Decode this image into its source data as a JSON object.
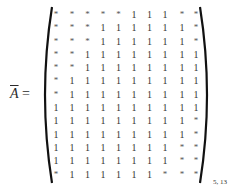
{
  "equation": {
    "lhs_symbol": "A",
    "lhs_decoration": "overline",
    "equals": "=",
    "subscript": "5, 13"
  },
  "matrix": {
    "rows": 13,
    "cols": 10,
    "entries": [
      [
        "*",
        "*",
        "*",
        "*",
        "*",
        "1",
        "1",
        "1",
        "*",
        "*"
      ],
      [
        "*",
        "*",
        "*",
        "1",
        "1",
        "1",
        "1",
        "1",
        "1",
        "*"
      ],
      [
        "*",
        "*",
        "*",
        "1",
        "1",
        "1",
        "1",
        "1",
        "1",
        "*"
      ],
      [
        "*",
        "*",
        "1",
        "1",
        "1",
        "1",
        "1",
        "1",
        "1",
        "1"
      ],
      [
        "*",
        "*",
        "1",
        "1",
        "1",
        "1",
        "1",
        "1",
        "1",
        "1"
      ],
      [
        "*",
        "1",
        "1",
        "1",
        "1",
        "1",
        "1",
        "1",
        "1",
        "1"
      ],
      [
        "*",
        "1",
        "1",
        "1",
        "1",
        "1",
        "1",
        "1",
        "1",
        "1"
      ],
      [
        "1",
        "1",
        "1",
        "1",
        "1",
        "1",
        "1",
        "1",
        "1",
        "1"
      ],
      [
        "1",
        "1",
        "1",
        "1",
        "1",
        "1",
        "1",
        "1",
        "1",
        "*"
      ],
      [
        "1",
        "1",
        "1",
        "1",
        "1",
        "1",
        "1",
        "1",
        "1",
        "*"
      ],
      [
        "1",
        "1",
        "1",
        "1",
        "1",
        "1",
        "1",
        "1",
        "*",
        "*"
      ],
      [
        "1",
        "1",
        "1",
        "1",
        "1",
        "1",
        "1",
        "1",
        "*",
        "*"
      ],
      [
        "*",
        "1",
        "1",
        "1",
        "1",
        "1",
        "1",
        "*",
        "*",
        "*"
      ]
    ]
  }
}
